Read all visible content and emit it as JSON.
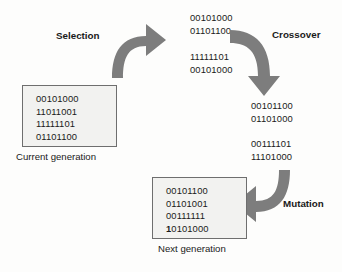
{
  "diagram": {
    "accent_gray": "#7d7d7d",
    "box_fill": "#f2f2f0",
    "box_border": "#6e6e6e"
  },
  "steps": {
    "selection": {
      "label": "Selection",
      "icon": "curved-arrow-right-icon"
    },
    "crossover": {
      "label": "Crossover",
      "icon": "curved-arrow-down-icon"
    },
    "mutation": {
      "label": "Mutation",
      "icon": "curved-arrow-left-icon"
    }
  },
  "current_generation": {
    "caption": "Current generation",
    "chromosomes": [
      "00101000",
      "11011001",
      "11111101",
      "01101100"
    ]
  },
  "selected_pairs": {
    "pair1": [
      "00101000",
      "01101100"
    ],
    "pair2": [
      "11111101",
      "00101000"
    ]
  },
  "crossover_pairs": {
    "pair1": [
      "00101100",
      "01101000"
    ],
    "pair2": [
      "00111101",
      "11101000"
    ]
  },
  "next_generation": {
    "caption": "Next generation",
    "chromosomes": [
      "00101100",
      "01101001",
      "00111111"
    ],
    "mutated": {
      "bit": "1",
      "rest": "0101000"
    }
  }
}
